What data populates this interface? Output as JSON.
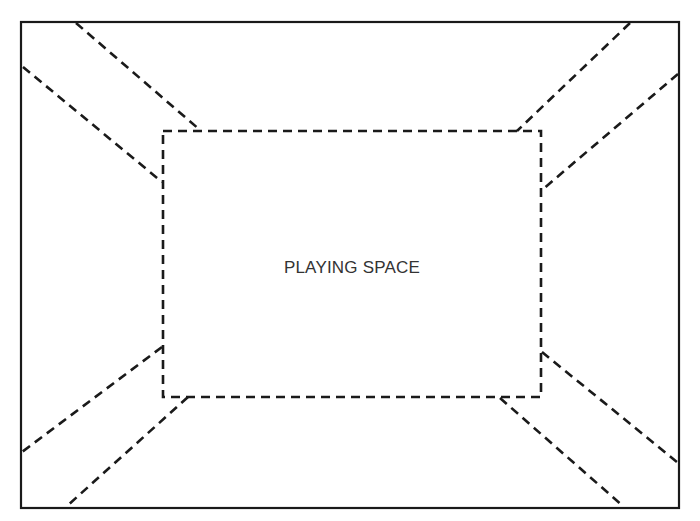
{
  "diagram": {
    "title": "PLAYING SPACE",
    "stroke_color": "#1a1a1a",
    "background": "#ffffff",
    "outer_frame": {
      "x1": 21,
      "y1": 22,
      "x2": 679,
      "y2": 508,
      "style": "solid"
    },
    "playing_space": {
      "x1": 163,
      "y1": 131,
      "x2": 541,
      "y2": 397,
      "style": "dashed",
      "label": "PLAYING SPACE"
    },
    "diagonal_aisles": [
      {
        "corner": "top-left",
        "lines": [
          [
            76,
            23,
            200,
            130
          ],
          [
            23,
            67,
            162,
            182
          ]
        ]
      },
      {
        "corner": "top-right",
        "lines": [
          [
            630,
            23,
            517,
            131
          ],
          [
            678,
            74,
            542,
            190
          ]
        ]
      },
      {
        "corner": "bottom-left",
        "lines": [
          [
            162,
            347,
            22,
            452
          ],
          [
            188,
            397,
            67,
            506
          ]
        ]
      },
      {
        "corner": "bottom-right",
        "lines": [
          [
            542,
            352,
            677,
            462
          ],
          [
            500,
            398,
            623,
            506
          ]
        ]
      }
    ]
  }
}
